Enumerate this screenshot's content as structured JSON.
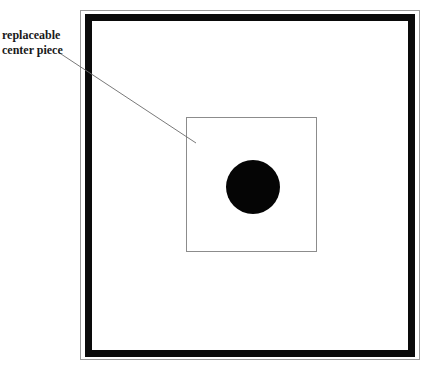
{
  "diagram": {
    "label": {
      "line1": "replaceable",
      "line2": "center piece"
    },
    "colors": {
      "frame": "#0a0a0a",
      "outer_border": "#9a9a9a",
      "inner_square": "#8c8c8c",
      "center_circle": "#050505",
      "leader_line": "#6a6a6a",
      "background": "#ffffff"
    }
  }
}
